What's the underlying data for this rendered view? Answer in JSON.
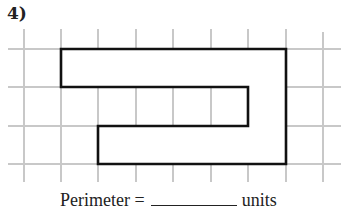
{
  "question": {
    "number_label": "4)",
    "answer_prefix": "Perimeter =",
    "answer_value": "",
    "answer_suffix": "units"
  },
  "grid": {
    "x_lines": [
      24,
      61,
      98,
      136,
      173,
      211,
      248,
      286,
      323
    ],
    "y_lines": [
      49,
      87,
      126,
      164
    ],
    "grid_color": "#c8c8c8",
    "cell_size_px": 37.5
  },
  "shape": {
    "description": "C-shaped rectilinear polygon on unit grid",
    "vertices_grid_units": [
      [
        1,
        0
      ],
      [
        7,
        0
      ],
      [
        7,
        3
      ],
      [
        2,
        3
      ],
      [
        2,
        2
      ],
      [
        6,
        2
      ],
      [
        6,
        1
      ],
      [
        1,
        1
      ]
    ],
    "outline_color": "#111111"
  }
}
